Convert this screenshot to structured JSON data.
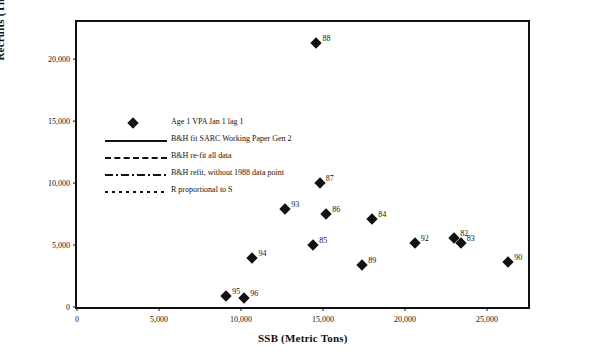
{
  "chart_data": {
    "type": "scatter",
    "title": "",
    "xlabel": "SSB (Metric Tons)",
    "ylabel": "Recruits (Thousands)",
    "xlim": [
      0,
      27500
    ],
    "ylim": [
      0,
      23000
    ],
    "xticks": [
      "0",
      "5,000",
      "10,000",
      "15,000",
      "20,000",
      "25,000"
    ],
    "xtick_values": [
      0,
      5000,
      10000,
      15000,
      20000,
      25000
    ],
    "yticks": [
      "0",
      "5,000",
      "10,000",
      "15,000",
      "20,000"
    ],
    "ytick_values": [
      0,
      5000,
      10000,
      15000,
      20000
    ],
    "grid": false,
    "legend_position": "upper-left-inside",
    "series": [
      {
        "name": "Age 1 VPA Jan 1 lag 1",
        "type": "scatter",
        "marker": "diamond",
        "color": "#111111",
        "points": [
          {
            "label": "88",
            "x": 14600,
            "y": 21300
          },
          {
            "label": "87",
            "x": 14800,
            "y": 10000
          },
          {
            "label": "93",
            "x": 12700,
            "y": 7900
          },
          {
            "label": "86",
            "x": 15200,
            "y": 7500
          },
          {
            "label": "84",
            "x": 18000,
            "y": 7100
          },
          {
            "label": "85",
            "x": 14400,
            "y": 5000
          },
          {
            "label": "94",
            "x": 10700,
            "y": 3950
          },
          {
            "label": "92",
            "x": 20600,
            "y": 5200
          },
          {
            "label": "82",
            "x": 23000,
            "y": 5600
          },
          {
            "label": "83",
            "x": 23400,
            "y": 5150
          },
          {
            "label": "89",
            "x": 17400,
            "y": 3400
          },
          {
            "label": "95",
            "x": 9100,
            "y": 900
          },
          {
            "label": "96",
            "x": 10200,
            "y": 700
          },
          {
            "label": "90",
            "x": 26300,
            "y": 3600
          }
        ]
      },
      {
        "name": "B&H fit SARC Working Paper Gen 2",
        "type": "line",
        "style": "solid",
        "color": "#111111",
        "curve": [
          {
            "x": 0,
            "y": 0
          },
          {
            "x": 500,
            "y": 1250
          },
          {
            "x": 1000,
            "y": 2150
          },
          {
            "x": 1500,
            "y": 2750
          },
          {
            "x": 2000,
            "y": 3200
          },
          {
            "x": 3000,
            "y": 3750
          },
          {
            "x": 4000,
            "y": 4100
          },
          {
            "x": 5000,
            "y": 4300
          },
          {
            "x": 7000,
            "y": 4580
          },
          {
            "x": 9000,
            "y": 4740
          },
          {
            "x": 12000,
            "y": 4880
          },
          {
            "x": 15000,
            "y": 4970
          },
          {
            "x": 18000,
            "y": 5040
          },
          {
            "x": 21000,
            "y": 5100
          },
          {
            "x": 24000,
            "y": 5150
          },
          {
            "x": 27500,
            "y": 5200
          }
        ]
      },
      {
        "name": "B&H re-fit all data",
        "type": "line",
        "style": "dashed",
        "color": "#111111",
        "curve": [
          {
            "x": 0,
            "y": 0
          },
          {
            "x": 1000,
            "y": 480
          },
          {
            "x": 2000,
            "y": 900
          },
          {
            "x": 4000,
            "y": 1650
          },
          {
            "x": 6000,
            "y": 2280
          },
          {
            "x": 8000,
            "y": 2850
          },
          {
            "x": 10000,
            "y": 3350
          },
          {
            "x": 12000,
            "y": 3800
          },
          {
            "x": 14000,
            "y": 4200
          },
          {
            "x": 16000,
            "y": 4580
          },
          {
            "x": 18000,
            "y": 4920
          },
          {
            "x": 20000,
            "y": 5240
          },
          {
            "x": 22000,
            "y": 5540
          },
          {
            "x": 24000,
            "y": 5820
          },
          {
            "x": 26000,
            "y": 6080
          },
          {
            "x": 27500,
            "y": 6260
          }
        ]
      },
      {
        "name": "B&H refit, without 1988 data point",
        "type": "line",
        "style": "dash-dot",
        "color": "#111111",
        "curve": [
          {
            "x": 0,
            "y": 0
          },
          {
            "x": 1000,
            "y": 380
          },
          {
            "x": 2000,
            "y": 730
          },
          {
            "x": 4000,
            "y": 1370
          },
          {
            "x": 6000,
            "y": 1940
          },
          {
            "x": 8000,
            "y": 2460
          },
          {
            "x": 10000,
            "y": 2930
          },
          {
            "x": 12000,
            "y": 3360
          },
          {
            "x": 14000,
            "y": 3760
          },
          {
            "x": 16000,
            "y": 4130
          },
          {
            "x": 18000,
            "y": 4480
          },
          {
            "x": 20000,
            "y": 4800
          },
          {
            "x": 22000,
            "y": 5100
          },
          {
            "x": 24000,
            "y": 5390
          },
          {
            "x": 26000,
            "y": 5660
          },
          {
            "x": 27500,
            "y": 5850
          }
        ]
      },
      {
        "name": "R proportional to S",
        "type": "line",
        "style": "dotted",
        "color": "#111111",
        "curve": [
          {
            "x": 0,
            "y": 0
          },
          {
            "x": 27500,
            "y": 8400
          }
        ]
      }
    ]
  },
  "legend": {
    "items": [
      {
        "label": "Age 1 VPA Jan 1 lag 1",
        "key": "diamond"
      },
      {
        "label": "B&H fit SARC Working Paper Gen 2",
        "key": "solid"
      },
      {
        "label": "B&H re-fit all data",
        "key": "dashed"
      },
      {
        "label": "B&H refit, without 1988 data point",
        "key": "dash-dot"
      },
      {
        "label": "R proportional to S",
        "key": "dotted"
      }
    ]
  }
}
